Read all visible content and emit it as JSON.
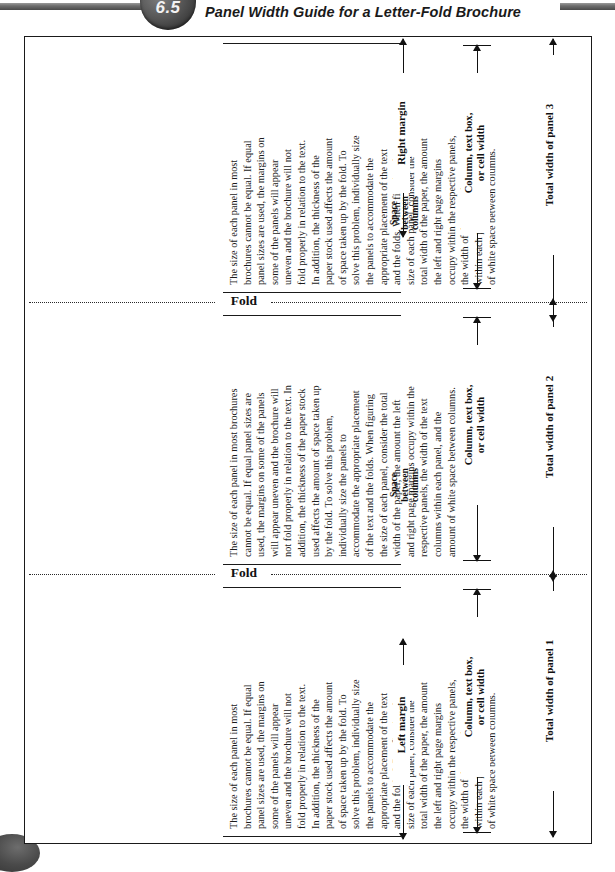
{
  "header": {
    "number": "6.5",
    "title": "Panel Width Guide for a Letter-Fold Brochure"
  },
  "figure": {
    "fold_label": "Fold",
    "space_between_label": "Space\nbetween\ncolumns",
    "column_width_label": "Column, text box,\nor cell width",
    "left_margin_label": "Left margin",
    "right_margin_label": "Right margin",
    "panels": [
      {
        "id": "panel-1",
        "total_width_label": "Total width of panel 1",
        "body": "The size of each panel in most\nbrochures cannot be equal. If equal\npanel sizes are used, the margins on\nsome of the panels will appear\nuneven and the brochure will not\nfold properly in relation to the text.\nIn addition, the thickness of the\npaper stock used affects the amount\nof space taken up by the fold. To\nsolve this problem, individually size\nthe panels to accommodate the\nappropriate placement of the text\nand the folds. When figuring the\nsize of each panel, consider the\ntotal width of the paper, the amount\nthe left and right page margins\noccupy within the respective panels,\nthe width of the text columns\nwithin each panel, and the amount\nof white space between columns."
      },
      {
        "id": "panel-2",
        "total_width_label": "Total width of panel 2",
        "body": "The size of each panel in most brochures\ncannot be equal. If equal panel sizes are\nused, the margins on some of the panels\nwill appear uneven and the brochure will\nnot fold properly in relation to the text. In\naddition, the thickness of the paper stock\nused affects the amount of space taken up\nby the fold. To solve this problem,\nindividually size the panels to\naccommodate the appropriate placement\nof the text and the folds. When figuring\nthe size of each panel, consider the total\nwidth of the paper, the amount the left\nand right page margins occupy within the\nrespective panels, the width of the text\ncolumns within each panel, and the\namount of white space between columns."
      },
      {
        "id": "panel-3",
        "total_width_label": "Total width of panel 3",
        "body": "The size of each panel in most\nbrochures cannot be equal. If equal\npanel sizes are used, the margins on\nsome of the panels will appear\nuneven and the brochure will not\nfold properly in relation to the text.\nIn addition, the thickness of the\npaper stock used affects the amount\nof space taken up by the fold. To\nsolve this problem, individually size\nthe panels to accommodate the\nappropriate placement of the text\nand the folds. When figuring the\nsize of each panel, consider the\ntotal width of the paper, the amount\nthe left and right page margins\noccupy within the respective panels,\nthe width of the text columns\nwithin each panel, and the amount\nof white space between columns."
      }
    ]
  }
}
